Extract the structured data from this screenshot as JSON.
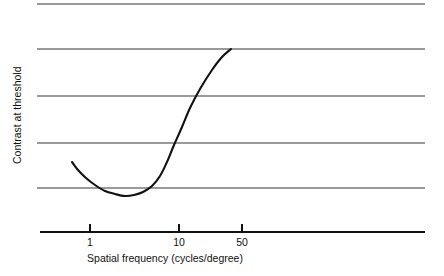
{
  "chart_data": {
    "type": "line",
    "title": "",
    "xlabel": "Spatial frequency (cycles/degree)",
    "ylabel": "Contrast at threshold",
    "xscale": "log",
    "yscale": "linear",
    "grid": true,
    "legend": false,
    "xticks": [
      {
        "label": "1",
        "value": 1,
        "px": 90
      },
      {
        "label": "10",
        "value": 10,
        "px": 179
      },
      {
        "label": "50",
        "value": 50,
        "px": 242
      }
    ],
    "yticks": [],
    "gridlines_px_y": [
      4,
      49,
      96,
      143,
      188
    ],
    "axis_px": {
      "x_left": 37,
      "x_right": 425,
      "y_axis": 232
    },
    "series": [
      {
        "name": "Contrast sensitivity function",
        "x": [
          0.55,
          0.7,
          0.9,
          1.2,
          1.6,
          2.2,
          3.0,
          4.0,
          5.5,
          7.5,
          10.0,
          13.0,
          17.0,
          22.0,
          28.0
        ],
        "y": [
          0.46,
          0.38,
          0.3,
          0.24,
          0.19,
          0.16,
          0.14,
          0.135,
          0.15,
          0.21,
          0.33,
          0.52,
          0.72,
          0.88,
          1.0
        ],
        "points_px": [
          [
            72,
            162
          ],
          [
            78,
            170
          ],
          [
            86,
            178
          ],
          [
            95,
            185
          ],
          [
            105,
            191
          ],
          [
            115,
            194
          ],
          [
            125,
            196
          ],
          [
            134,
            195
          ],
          [
            143,
            192
          ],
          [
            152,
            186
          ],
          [
            160,
            176
          ],
          [
            167,
            162
          ],
          [
            174,
            145
          ],
          [
            182,
            127
          ],
          [
            190,
            108
          ],
          [
            200,
            89
          ],
          [
            212,
            70
          ],
          [
            222,
            57
          ],
          [
            231,
            49
          ]
        ]
      }
    ],
    "annotations": []
  },
  "figure": {
    "width": 444,
    "height": 276,
    "background": "#ffffff",
    "curve_color": "#111111",
    "grid_color": "#9a9a9a",
    "axis_color": "#111111"
  }
}
